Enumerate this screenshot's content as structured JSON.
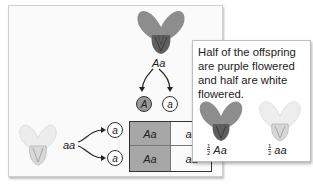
{
  "parent_top": {
    "genotype": "Aa",
    "phenotype": "purple-flower"
  },
  "parent_left": {
    "genotype": "aa",
    "phenotype": "white-flower"
  },
  "gametes_top": [
    "A",
    "a"
  ],
  "gametes_left": [
    "a",
    "a"
  ],
  "punnett": {
    "rows": [
      [
        "Aa",
        "aa"
      ],
      [
        "Aa",
        "aa"
      ]
    ]
  },
  "callout": {
    "text": "Half of the offspring are purple flowered and half are white flowered.",
    "offspring": [
      {
        "fraction_num": "1",
        "fraction_den": "2",
        "genotype": "Aa",
        "phenotype": "purple-flower"
      },
      {
        "fraction_num": "1",
        "fraction_den": "2",
        "genotype": "aa",
        "phenotype": "white-flower"
      }
    ]
  },
  "colors": {
    "purple_flower": "#8a8a8a",
    "white_flower": "#eeeeee",
    "dominant_shade": "#a7a7a7"
  }
}
